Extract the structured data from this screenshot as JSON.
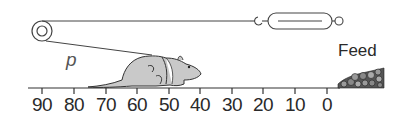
{
  "diagram": {
    "labels": {
      "p": "p",
      "feed": "Feed"
    },
    "scale": {
      "ticks": [
        "90",
        "80",
        "70",
        "60",
        "50",
        "40",
        "30",
        "20",
        "10",
        "0"
      ]
    },
    "elements": [
      "pulley",
      "cord",
      "spring-scale",
      "rat",
      "harness",
      "feed-pile",
      "distance-scale"
    ]
  }
}
